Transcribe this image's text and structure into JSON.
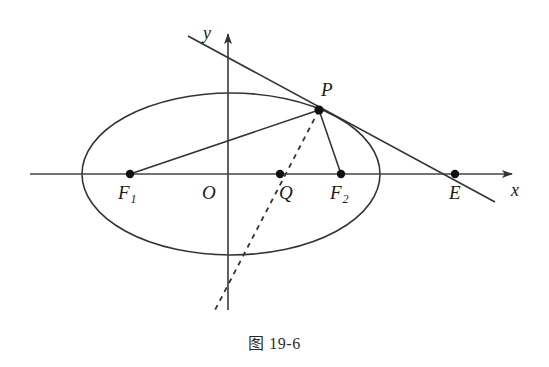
{
  "figure": {
    "caption": "图 19-6",
    "stroke_color": "#333333",
    "point_color": "#111111",
    "background": "#ffffff",
    "axes": {
      "x_label": "x",
      "y_label": "y",
      "x_axis": {
        "y": 174,
        "x_start": 30,
        "x_end": 518
      },
      "y_axis": {
        "x": 228,
        "y_top": 28,
        "y_bottom": 310
      }
    },
    "ellipse": {
      "cx": 231,
      "cy": 174,
      "rx": 149,
      "ry": 81
    },
    "points": [
      {
        "name": "F1",
        "label": "F",
        "sub": "1",
        "x": 130,
        "y": 174,
        "label_x": 118,
        "label_y": 183
      },
      {
        "name": "O",
        "label": "O",
        "sub": "",
        "x": 228,
        "y": 174,
        "label_x": 202,
        "label_y": 183
      },
      {
        "name": "Q",
        "label": "Q",
        "sub": "",
        "x": 280,
        "y": 174,
        "label_x": 279,
        "label_y": 183
      },
      {
        "name": "F2",
        "label": "F",
        "sub": "2",
        "x": 341,
        "y": 174,
        "label_x": 330,
        "label_y": 183
      },
      {
        "name": "E",
        "label": "E",
        "sub": "",
        "x": 455,
        "y": 174,
        "label_x": 449,
        "label_y": 183
      },
      {
        "name": "P",
        "label": "P",
        "sub": "",
        "x": 319,
        "y": 110,
        "label_x": 321,
        "label_y": 80
      }
    ],
    "segments": [
      {
        "name": "chord-F1-P",
        "x1": 130,
        "y1": 174,
        "x2": 319,
        "y2": 110,
        "style": "solid"
      },
      {
        "name": "segment-P-F2",
        "x1": 319,
        "y1": 110,
        "x2": 341,
        "y2": 174,
        "style": "solid"
      },
      {
        "name": "tangent-line-through-P",
        "x1": 188,
        "y1": 36,
        "x2": 495,
        "y2": 202,
        "style": "solid"
      },
      {
        "name": "bisector-P-Q-dashed",
        "x1": 319,
        "y1": 110,
        "x2": 215,
        "y2": 310,
        "style": "dashed"
      }
    ]
  }
}
